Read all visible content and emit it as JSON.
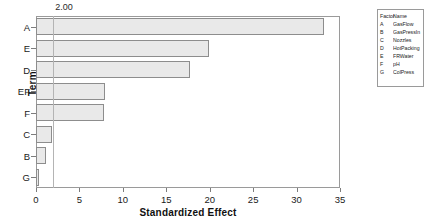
{
  "chart_data": {
    "type": "bar",
    "orientation": "horizontal",
    "title": "",
    "xlabel": "Standardized Effect",
    "ylabel": "Term",
    "categories": [
      "A",
      "E",
      "D",
      "EF",
      "F",
      "C",
      "B",
      "G"
    ],
    "values": [
      33.2,
      19.9,
      17.7,
      7.9,
      7.8,
      1.8,
      1.1,
      0.4
    ],
    "xlim": [
      0,
      35.0
    ],
    "xticks": [
      "0",
      "5",
      "10",
      "15",
      "20",
      "25",
      "30",
      "35"
    ],
    "xtick_values": [
      0,
      5,
      10,
      15,
      20,
      25,
      30,
      35
    ],
    "grid": false,
    "reference_line": {
      "label": "2.00",
      "value": 2.0
    },
    "legend": {
      "position": "right",
      "headers": [
        "Factor",
        "Name"
      ],
      "rows": [
        {
          "factor": "A",
          "name": "GasFlow"
        },
        {
          "factor": "B",
          "name": "GasPressIn"
        },
        {
          "factor": "C",
          "name": "Nozzles"
        },
        {
          "factor": "D",
          "name": "HotPacking"
        },
        {
          "factor": "E",
          "name": "FRWater"
        },
        {
          "factor": "F",
          "name": "pH"
        },
        {
          "factor": "G",
          "name": "ColPress"
        }
      ]
    },
    "colors": {
      "bar_fill": "#e9e9e9",
      "bar_border": "#8d8d8d",
      "axis": "#9a9a9a",
      "reference_line": "#b4b4b4",
      "text": "#1a1a1a",
      "background": "#ffffff"
    }
  }
}
